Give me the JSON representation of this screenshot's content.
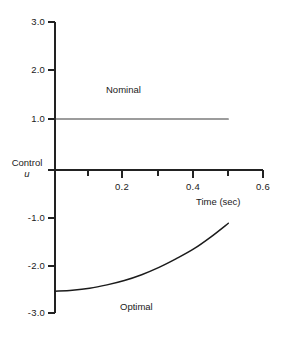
{
  "chart_data": {
    "type": "line",
    "title": "",
    "xlabel": "Time (sec)",
    "ylabel": "Control u",
    "xlim": [
      0,
      0.6
    ],
    "ylim": [
      -3.0,
      3.0
    ],
    "grid": false,
    "legend_position": "inline-annotation",
    "x_ticks": [
      0.2,
      0.4,
      0.6
    ],
    "x_ticks_labels": [
      "0.2",
      "0.4",
      "0.6"
    ],
    "x_minor_ticks": [
      0.1,
      0.3,
      0.5
    ],
    "y_ticks": [
      3.0,
      2.0,
      1.0,
      0.0,
      -1.0,
      -2.0,
      -3.0
    ],
    "y_ticks_labels": [
      "3.0",
      "2.0",
      "1.0",
      "",
      "-1.0",
      "-2.0",
      "-3.0"
    ],
    "series": [
      {
        "name": "Nominal",
        "x": [
          0.0,
          0.05,
          0.1,
          0.15,
          0.2,
          0.25,
          0.3,
          0.35,
          0.4,
          0.45,
          0.5
        ],
        "values": [
          1.0,
          1.0,
          1.0,
          1.0,
          1.0,
          1.0,
          1.0,
          1.0,
          1.0,
          1.0,
          1.0
        ]
      },
      {
        "name": "Optimal",
        "x": [
          0.0,
          0.05,
          0.1,
          0.15,
          0.2,
          0.25,
          0.3,
          0.35,
          0.4,
          0.45,
          0.5
        ],
        "values": [
          -2.55,
          -2.53,
          -2.49,
          -2.42,
          -2.33,
          -2.21,
          -2.06,
          -1.88,
          -1.68,
          -1.43,
          -1.15
        ]
      }
    ],
    "annotations": [
      {
        "text": "Nominal",
        "x": 0.22,
        "y": 1.55
      },
      {
        "text": "Optimal",
        "x": 0.27,
        "y": -2.82
      }
    ]
  },
  "labels": {
    "y_axis_name": "Control",
    "y_axis_symbol": "u",
    "x_axis_title": "Time (sec)",
    "nominal": "Nominal",
    "optimal": "Optimal",
    "y_3_0": "3.0",
    "y_2_0": "2.0",
    "y_1_0": "1.0",
    "y_m1_0": "-1.0",
    "y_m2_0": "-2.0",
    "y_m3_0": "-3.0",
    "x_0_2": "0.2",
    "x_0_4": "0.4",
    "x_0_6": "0.6"
  },
  "colors": {
    "background": "#ffffff",
    "axis": "#222222",
    "line": "#1b1b1b",
    "text": "#1a1a1a"
  }
}
